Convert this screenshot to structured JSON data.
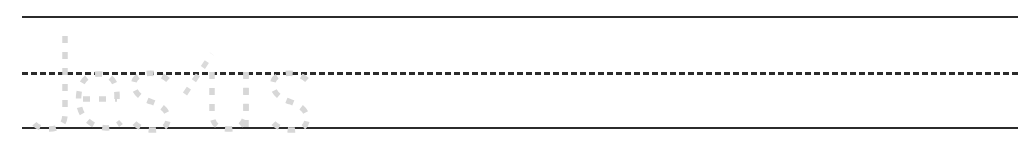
{
  "worksheet": {
    "type": "handwriting-tracing-line",
    "width_px": 1032,
    "height_px": 145,
    "background_color": "#ffffff",
    "traced_word": "Jesus",
    "traced_word_letters": [
      "J",
      "e",
      "s",
      "u",
      "s"
    ],
    "trace_style": "dashed-outline",
    "trace_color": "#d7d7d7",
    "alt_text": "Handwriting practice line with the word Jesus shown as light gray dashed tracing guides"
  },
  "guide_lines": {
    "line_color": "#2b2b2b",
    "left_px": 22,
    "right_px": 1018,
    "items": [
      {
        "name": "top-line",
        "label": "Ascender line",
        "style": "solid",
        "y_px": 16,
        "thickness_px": 2
      },
      {
        "name": "middle-line",
        "label": "Midline (x-height)",
        "style": "dashed",
        "y_px": 72,
        "thickness_px": 3,
        "dash_px": 15,
        "gap_px": 17
      },
      {
        "name": "bottom-line",
        "label": "Baseline",
        "style": "solid",
        "y_px": 127,
        "thickness_px": 2
      }
    ]
  },
  "writing_area": {
    "label": "Blank practice space",
    "hint": "Trace the word, then keep writing it across the line"
  }
}
